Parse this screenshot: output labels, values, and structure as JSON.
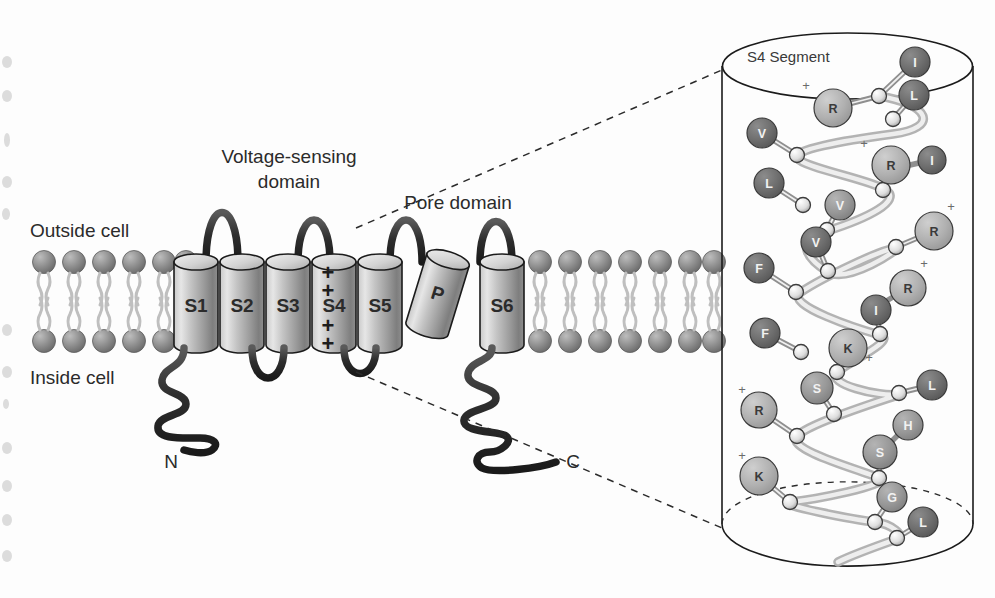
{
  "figure": {
    "background": "#fdfdfd"
  },
  "labels": {
    "outside_cell": "Outside cell",
    "inside_cell": "Inside cell",
    "voltage_sensing_domain_line1": "Voltage-sensing",
    "voltage_sensing_domain_line2": "domain",
    "pore_domain": "Pore domain",
    "n_terminus": "N",
    "c_terminus": "C",
    "s4_segment_title": "S4 Segment"
  },
  "segments": [
    {
      "id": "S1",
      "label": "S1",
      "x": 196,
      "charges": 0
    },
    {
      "id": "S2",
      "label": "S2",
      "x": 242,
      "charges": 0
    },
    {
      "id": "S3",
      "label": "S3",
      "x": 288,
      "charges": 0
    },
    {
      "id": "S4",
      "label": "S4",
      "x": 334,
      "charges": 4
    },
    {
      "id": "S5",
      "label": "S5",
      "x": 380,
      "charges": 0
    },
    {
      "id": "P",
      "label": "P",
      "x": 437,
      "charges": 0
    },
    {
      "id": "S6",
      "label": "S6",
      "x": 502,
      "charges": 0
    }
  ],
  "s4_charge_marks": [
    "+",
    "+",
    "+",
    "+"
  ],
  "membrane": {
    "left_lipid_count": 6,
    "right_lipid_count": 10,
    "outer_leaflet_y": 258,
    "inner_leaflet_y": 345,
    "head_color": "#8d8d8d",
    "tail_color": "#b9b9b9"
  },
  "colors": {
    "cylinder_light": "#e0e0e0",
    "cylinder_mid": "#b5b5b5",
    "cylinder_dark": "#7f7f7f",
    "outline": "#1b1b1b",
    "backbone_ribbon": "#d7d7d7",
    "residue_charged": "#b3b3b3",
    "residue_hydrophobic": "#6e6e6e",
    "residue_polar": "#9a9a9a",
    "dashed_leader": "#2b2b2b"
  },
  "s4_helix": {
    "description": "Alpha-helical S4 segment backbone with side-chain residues; basic residues (R, K) carry + charges",
    "sequence": [
      "I",
      "R",
      "L",
      "V",
      "R",
      "I",
      "L",
      "V",
      "V",
      "R",
      "F",
      "I",
      "R",
      "F",
      "K",
      "S",
      "L",
      "R",
      "S",
      "H",
      "K",
      "G",
      "L"
    ],
    "residues": [
      {
        "label": "I",
        "type": "hydrophobic",
        "charge": "",
        "cx": 915,
        "cy": 62,
        "r": 15,
        "node_x": 879,
        "node_y": 96
      },
      {
        "label": "R",
        "type": "charged",
        "charge": "+",
        "cx": 833,
        "cy": 108,
        "r": 19,
        "node_x": 879,
        "node_y": 96,
        "plus_x": 806,
        "plus_y": 90
      },
      {
        "label": "L",
        "type": "hydrophobic",
        "charge": "",
        "cx": 914,
        "cy": 95,
        "r": 15,
        "node_x": 893,
        "node_y": 119
      },
      {
        "label": "V",
        "type": "hydrophobic",
        "charge": "",
        "cx": 762,
        "cy": 133,
        "r": 15,
        "node_x": 797,
        "node_y": 155
      },
      {
        "label": "R",
        "type": "charged",
        "charge": "+",
        "cx": 891,
        "cy": 165,
        "r": 19,
        "node_x": 883,
        "node_y": 190,
        "plus_x": 864,
        "plus_y": 148
      },
      {
        "label": "I",
        "type": "hydrophobic",
        "charge": "",
        "cx": 932,
        "cy": 160,
        "r": 14,
        "node_x": 910,
        "node_y": 165
      },
      {
        "label": "L",
        "type": "hydrophobic",
        "charge": "",
        "cx": 769,
        "cy": 183,
        "r": 15,
        "node_x": 803,
        "node_y": 205
      },
      {
        "label": "V",
        "type": "polar",
        "charge": "",
        "cx": 840,
        "cy": 205,
        "r": 15,
        "node_x": 827,
        "node_y": 230
      },
      {
        "label": "V",
        "type": "hydrophobic",
        "charge": "",
        "cx": 816,
        "cy": 242,
        "r": 15,
        "node_x": 828,
        "node_y": 271
      },
      {
        "label": "R",
        "type": "charged",
        "charge": "+",
        "cx": 934,
        "cy": 231,
        "r": 19,
        "node_x": 896,
        "node_y": 247,
        "plus_x": 951,
        "plus_y": 211
      },
      {
        "label": "F",
        "type": "hydrophobic",
        "charge": "",
        "cx": 759,
        "cy": 268,
        "r": 15,
        "node_x": 796,
        "node_y": 292
      },
      {
        "label": "I",
        "type": "hydrophobic",
        "charge": "",
        "cx": 876,
        "cy": 310,
        "r": 15,
        "node_x": 880,
        "node_y": 334
      },
      {
        "label": "R",
        "type": "charged",
        "charge": "+",
        "cx": 908,
        "cy": 288,
        "r": 18,
        "node_x": 888,
        "node_y": 300,
        "plus_x": 924,
        "plus_y": 268
      },
      {
        "label": "F",
        "type": "hydrophobic",
        "charge": "",
        "cx": 765,
        "cy": 333,
        "r": 15,
        "node_x": 801,
        "node_y": 352
      },
      {
        "label": "K",
        "type": "charged",
        "charge": "+",
        "cx": 848,
        "cy": 348,
        "r": 19,
        "node_x": 837,
        "node_y": 372,
        "plus_x": 869,
        "plus_y": 362
      },
      {
        "label": "S",
        "type": "polar",
        "charge": "",
        "cx": 817,
        "cy": 388,
        "r": 16,
        "node_x": 834,
        "node_y": 414
      },
      {
        "label": "L",
        "type": "hydrophobic",
        "charge": "",
        "cx": 932,
        "cy": 385,
        "r": 15,
        "node_x": 899,
        "node_y": 393
      },
      {
        "label": "R",
        "type": "charged",
        "charge": "+",
        "cx": 759,
        "cy": 410,
        "r": 18,
        "node_x": 797,
        "node_y": 436,
        "plus_x": 742,
        "plus_y": 394
      },
      {
        "label": "S",
        "type": "polar",
        "charge": "",
        "cx": 880,
        "cy": 452,
        "r": 17,
        "node_x": 879,
        "node_y": 478
      },
      {
        "label": "H",
        "type": "polar",
        "charge": "",
        "cx": 908,
        "cy": 425,
        "r": 15,
        "node_x": 893,
        "node_y": 440
      },
      {
        "label": "K",
        "type": "charged",
        "charge": "+",
        "cx": 759,
        "cy": 476,
        "r": 19,
        "node_x": 790,
        "node_y": 502,
        "plus_x": 742,
        "plus_y": 460
      },
      {
        "label": "G",
        "type": "polar",
        "charge": "",
        "cx": 892,
        "cy": 497,
        "r": 15,
        "node_x": 875,
        "node_y": 522
      },
      {
        "label": "L",
        "type": "hydrophobic",
        "charge": "",
        "cx": 923,
        "cy": 522,
        "r": 15,
        "node_x": 897,
        "node_y": 538
      }
    ]
  },
  "leaders": [
    {
      "name": "upper-leader",
      "from_x": 356,
      "from_y": 228,
      "to_x": 722,
      "to_y": 70
    },
    {
      "name": "lower-leader",
      "from_x": 356,
      "from_y": 372,
      "to_x": 722,
      "to_y": 528
    }
  ]
}
